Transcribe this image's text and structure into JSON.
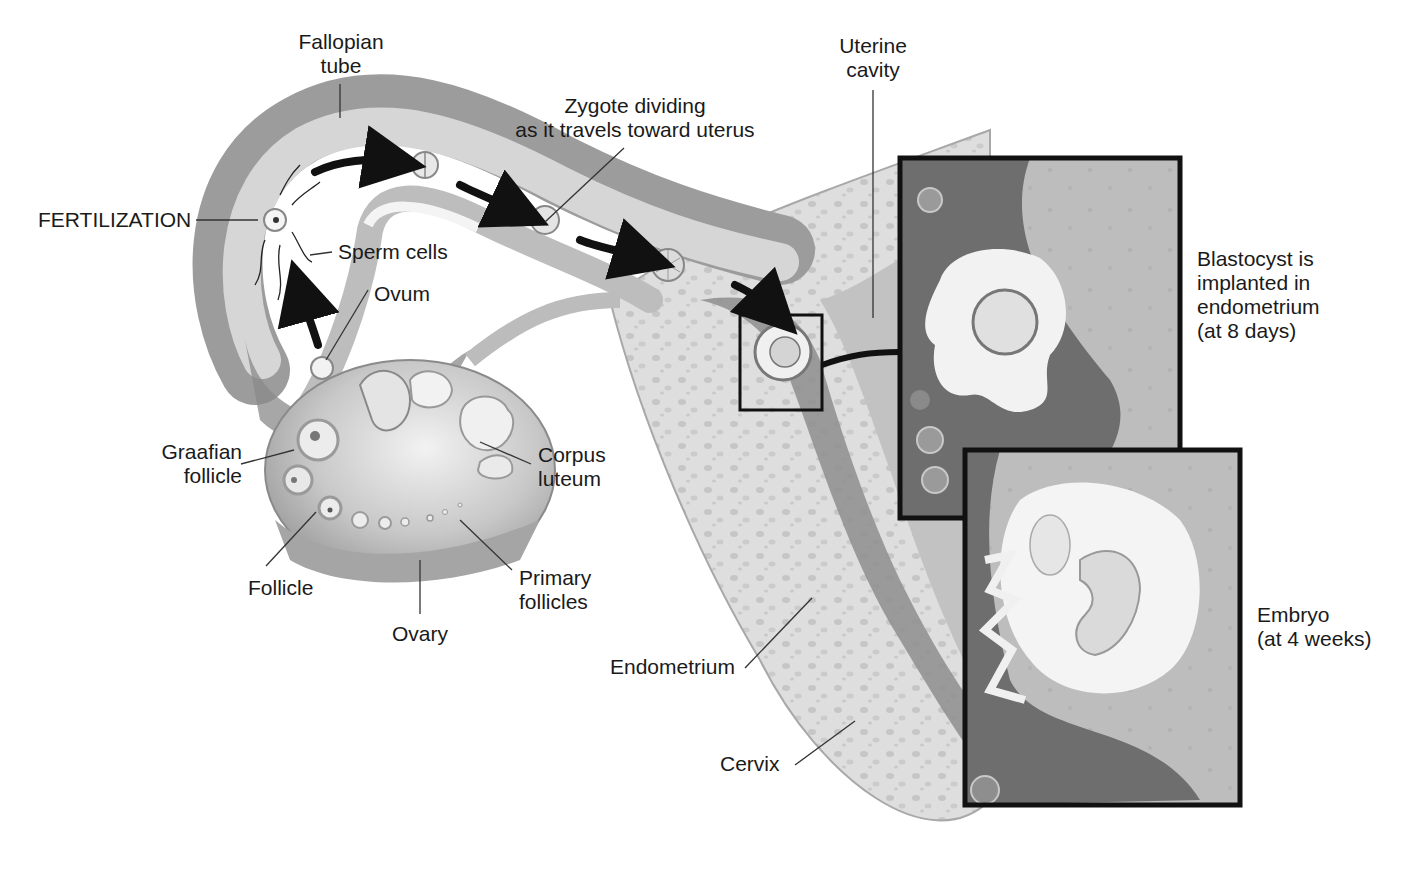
{
  "diagram": {
    "colors": {
      "background": "#ffffff",
      "tissue_light": "#dcdcdc",
      "tissue_mid": "#b4b4b4",
      "tissue_dark": "#7e7e7e",
      "inset_dark": "#6e6e6e",
      "arrow": "#111111",
      "leader": "#333333",
      "inset_border": "#111111"
    },
    "labels": {
      "fallopian_tube": [
        "Fallopian",
        "tube"
      ],
      "fertilization": "FERTILIZATION",
      "sperm_cells": "Sperm cells",
      "ovum": "Ovum",
      "zygote": [
        "Zygote dividing",
        "as it travels toward uterus"
      ],
      "uterine_cavity": [
        "Uterine",
        "cavity"
      ],
      "blastocyst": [
        "Blastocyst is",
        "implanted in",
        "endometrium",
        "(at 8 days)"
      ],
      "graafian_follicle": [
        "Graafian",
        "follicle"
      ],
      "corpus_luteum": [
        "Corpus",
        "luteum"
      ],
      "follicle": "Follicle",
      "primary_follicles": [
        "Primary",
        "follicles"
      ],
      "ovary": "Ovary",
      "endometrium": "Endometrium",
      "embryo": [
        "Embryo",
        "(at 4 weeks)"
      ],
      "cervix": "Cervix"
    },
    "insets": [
      {
        "name": "blastocyst-inset",
        "caption_ref": "blastocyst"
      },
      {
        "name": "embryo-inset",
        "caption_ref": "embryo"
      }
    ]
  }
}
